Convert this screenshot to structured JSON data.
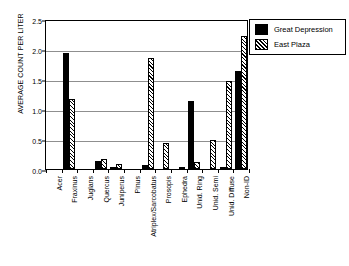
{
  "chart_data": {
    "type": "bar",
    "title": "",
    "xlabel": "",
    "ylabel": "AVERAGE COUNT PER LITER",
    "ylim": [
      0,
      2.5
    ],
    "yticks": [
      0.0,
      0.5,
      1.0,
      1.5,
      2.0,
      2.5
    ],
    "ytick_labels": [
      "0.0",
      "0.5",
      "1.0",
      "1.5",
      "2.0",
      "2.5"
    ],
    "grid": true,
    "legend_position": "top-right",
    "categories": [
      "Acer",
      "Fraxinus",
      "Juglans",
      "Quercus",
      "Juniperus",
      "Pinus",
      "Atriplex/Sarcobatus",
      "Prosopis",
      "Ephedra",
      "Unid. Ring",
      "Unid. Semi",
      "Unid. Diffuse",
      "Non-ID"
    ],
    "series": [
      {
        "name": "Great Depression",
        "fill": "solid-black",
        "color": "#000000",
        "values": [
          0.0,
          1.93,
          0.0,
          0.14,
          0.04,
          0.0,
          0.07,
          0.0,
          0.0,
          1.14,
          0.0,
          0.04,
          1.64
        ]
      },
      {
        "name": "East Plaza",
        "fill": "diagonal-hatch",
        "color": "#ffffff",
        "values": [
          0.0,
          1.17,
          0.0,
          0.17,
          0.09,
          0.0,
          1.85,
          0.43,
          0.02,
          0.12,
          0.48,
          1.46,
          2.21
        ]
      }
    ]
  },
  "legend": {
    "entries": [
      {
        "label": "Great Depression"
      },
      {
        "label": "East Plaza"
      }
    ]
  }
}
